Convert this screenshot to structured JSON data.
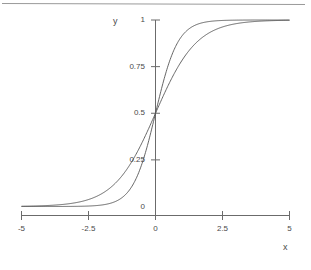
{
  "chart_data": {
    "type": "line",
    "title": "",
    "xlabel": "x",
    "ylabel": "y",
    "xlim": [
      -5,
      5
    ],
    "ylim": [
      0,
      1
    ],
    "grid": false,
    "legend": "none",
    "xticks": [
      -5,
      -2.5,
      0,
      2.5,
      5
    ],
    "xtick_labels": [
      "-5",
      "-2.5",
      "0",
      "2.5",
      "5"
    ],
    "yticks": [
      0,
      0.25,
      0.5,
      0.75,
      1
    ],
    "ytick_labels": [
      "0",
      "0.25",
      "0.5",
      "0.75",
      "1"
    ],
    "series": [
      {
        "name": "logistic-steep",
        "description": "logistic sigmoid 1/(1+exp(-k*x)) with k = 2.4",
        "k": 2.4,
        "x": [
          -5,
          -4.5,
          -4,
          -3.5,
          -3,
          -2.5,
          -2,
          -1.75,
          -1.5,
          -1.25,
          -1,
          -0.75,
          -0.5,
          -0.25,
          0,
          0.25,
          0.5,
          0.75,
          1,
          1.25,
          1.5,
          1.75,
          2,
          2.5,
          3,
          3.5,
          4,
          4.5,
          5
        ],
        "values": [
          6e-06,
          2e-05,
          7e-05,
          0.00022,
          0.00075,
          0.00247,
          0.00815,
          0.01468,
          0.02632,
          0.04658,
          0.08176,
          0.14185,
          0.23148,
          0.35434,
          0.5,
          0.64566,
          0.76852,
          0.85815,
          0.91824,
          0.95342,
          0.97368,
          0.98532,
          0.99185,
          0.99753,
          0.99925,
          0.99978,
          0.99993,
          0.99998,
          0.999994
        ]
      },
      {
        "name": "logistic-shallow",
        "description": "logistic sigmoid 1/(1+exp(-k*x)) with k = 1.3",
        "k": 1.3,
        "x": [
          -5,
          -4.5,
          -4,
          -3.5,
          -3,
          -2.5,
          -2,
          -1.75,
          -1.5,
          -1.25,
          -1,
          -0.75,
          -0.5,
          -0.25,
          0,
          0.25,
          0.5,
          0.75,
          1,
          1.25,
          1.5,
          1.75,
          2,
          2.5,
          3,
          3.5,
          4,
          4.5,
          5
        ],
        "values": [
          0.0015,
          0.00288,
          0.00549,
          0.01044,
          0.01984,
          0.03752,
          0.0691,
          0.09353,
          0.12503,
          0.16469,
          0.21417,
          0.27195,
          0.34471,
          0.4194,
          0.5,
          0.5806,
          0.65529,
          0.72805,
          0.78583,
          0.83531,
          0.87497,
          0.90647,
          0.9309,
          0.96248,
          0.98016,
          0.98956,
          0.99451,
          0.99712,
          0.9985
        ]
      }
    ],
    "crossing_point": {
      "x": 0,
      "y": 0.5
    }
  },
  "axes": {
    "y_axis_title": "y",
    "x_axis_title": "x"
  },
  "decorations": {
    "top_rule": ""
  }
}
